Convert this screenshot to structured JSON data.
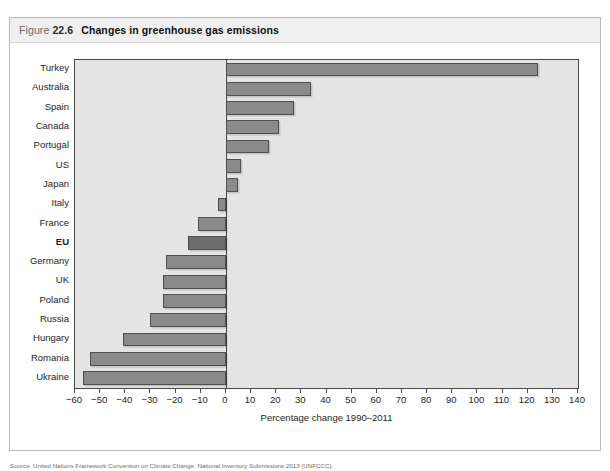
{
  "figure": {
    "number_prefix": "Figure ",
    "number": "22.6",
    "title": "Changes in greenhouse gas emissions"
  },
  "source_caption": "Source: United Nations Framework Convention on Climate Change, National Inventory Submissions 2013 (UNFCCC).",
  "colors": {
    "plot_background": "#e4e4e4",
    "bar_fill": "#8a8a8a",
    "bar_highlight_fill": "#6d6d6d",
    "bar_stroke": "#4f4f4f",
    "axis": "#4a4a4a",
    "title_bar_background": "#efefef"
  },
  "chart_data": {
    "type": "bar",
    "orientation": "horizontal",
    "title": "Changes in greenhouse gas emissions",
    "xlabel": "Percentage change 1990–2011",
    "ylabel": "",
    "xlim": [
      -60,
      140
    ],
    "xticks": [
      -60,
      -50,
      -40,
      -30,
      -20,
      -10,
      0,
      10,
      20,
      30,
      40,
      50,
      60,
      70,
      80,
      90,
      100,
      110,
      120,
      130,
      140
    ],
    "xtick_labels": [
      "−60",
      "−50",
      "−40",
      "−30",
      "−20",
      "−10",
      "0",
      "10",
      "20",
      "30",
      "40",
      "50",
      "60",
      "70",
      "80",
      "90",
      "100",
      "110",
      "120",
      "130",
      "140"
    ],
    "grid": false,
    "legend": null,
    "categories": [
      "Turkey",
      "Australia",
      "Spain",
      "Canada",
      "Portugal",
      "US",
      "Japan",
      "Italy",
      "France",
      "EU",
      "Germany",
      "UK",
      "Poland",
      "Russia",
      "Hungary",
      "Romania",
      "Ukraine"
    ],
    "values": [
      124,
      34,
      27,
      21,
      17,
      6,
      5,
      -3,
      -11,
      -15,
      -24,
      -25,
      -25,
      -30,
      -41,
      -54,
      -57
    ],
    "highlighted": [
      "EU"
    ]
  }
}
